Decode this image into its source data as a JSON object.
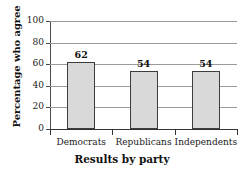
{
  "chart_data": {
    "type": "bar",
    "title": "",
    "categories": [
      "Democrats",
      "Republicans",
      "Independents"
    ],
    "values": [
      62,
      54,
      54
    ],
    "series": [
      {
        "name": "Percentage who agree",
        "values": [
          62,
          54,
          54
        ]
      }
    ],
    "xlabel": "Results by party",
    "ylabel": "Percentage who agree",
    "ylim": [
      0,
      100
    ],
    "yticks": [
      0,
      20,
      40,
      60,
      80,
      100
    ],
    "ytick_labels": [
      "0",
      "20",
      "40",
      "60",
      "80",
      "100"
    ],
    "value_labels": [
      "62",
      "54",
      "54"
    ],
    "grid": true,
    "grid_axis": "y",
    "legend": false,
    "legend_position": "none",
    "colors": {
      "bar_fill": "#d9d9d9",
      "bar_border": "#3d3d3d",
      "grid_line": "#9a9a9a",
      "axis": "#333333",
      "text": "#111111",
      "background": "#ffffff"
    }
  }
}
